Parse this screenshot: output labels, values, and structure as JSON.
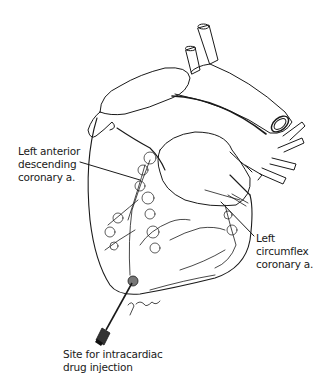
{
  "figure": {
    "colors": {
      "line": "#1a1a1a",
      "background": "#ffffff"
    }
  },
  "labels": {
    "lad": {
      "lines": [
        "Left anterior",
        "descending",
        "coronary a."
      ]
    },
    "lcx": {
      "lines": [
        "Left",
        "circumflex",
        "coronary a."
      ]
    },
    "injection_site": {
      "lines": [
        "Site for intracardiac",
        "drug injection"
      ]
    }
  },
  "signature": "F. Parks"
}
